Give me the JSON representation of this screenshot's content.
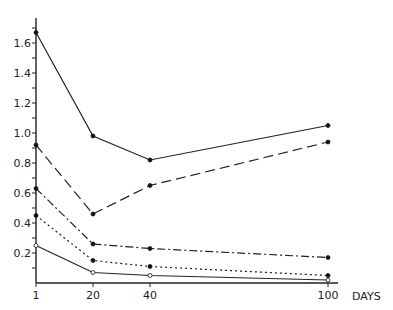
{
  "chart_data": {
    "type": "line",
    "title": "",
    "xlabel": "DAYS",
    "ylabel": "",
    "x": [
      1,
      20,
      40,
      100
    ],
    "x_ticks": [
      "1",
      "20",
      "40",
      "100"
    ],
    "y_ticks": [
      "0.2",
      "0.4",
      "0.6",
      "0.8",
      "1.0",
      "1.2",
      "1.4",
      "1.6"
    ],
    "ylim": [
      0,
      1.75
    ],
    "grid": false,
    "legend": null,
    "series": [
      {
        "name": "solid (upper)",
        "style": "solid",
        "marker": "filled",
        "values": [
          1.67,
          0.98,
          0.82,
          1.05
        ]
      },
      {
        "name": "long dash",
        "style": "dashed",
        "marker": "filled",
        "values": [
          0.92,
          0.46,
          0.65,
          0.94
        ]
      },
      {
        "name": "dash-dot",
        "style": "dashdot",
        "marker": "filled",
        "values": [
          0.63,
          0.26,
          0.23,
          0.17
        ]
      },
      {
        "name": "dotted",
        "style": "dotted",
        "marker": "filled",
        "values": [
          0.45,
          0.15,
          0.11,
          0.05
        ]
      },
      {
        "name": "solid (lower)",
        "style": "solid",
        "marker": "open",
        "values": [
          0.25,
          0.07,
          0.05,
          0.02
        ]
      }
    ]
  }
}
